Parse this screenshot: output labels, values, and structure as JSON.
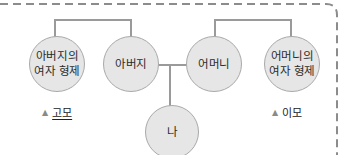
{
  "diagram": {
    "type": "family-tree",
    "colors": {
      "node_fill": "#e6e6e6",
      "node_border": "#a9a9a9",
      "connector": "#9a9a9a",
      "dashed_border": "#8c8c8c",
      "text": "#2b2b2b"
    },
    "nodes": [
      {
        "id": "father-sister",
        "lines": [
          "아버지의",
          "여자 형제"
        ]
      },
      {
        "id": "father",
        "lines": [
          "아버지"
        ]
      },
      {
        "id": "mother",
        "lines": [
          "어머니"
        ]
      },
      {
        "id": "mother-sister",
        "lines": [
          "어머니의",
          "여자 형제"
        ]
      },
      {
        "id": "me",
        "lines": [
          "나"
        ]
      }
    ],
    "edges": [
      {
        "from": "father-sister",
        "to": "father",
        "kind": "sibling"
      },
      {
        "from": "mother",
        "to": "mother-sister",
        "kind": "sibling"
      },
      {
        "from": "father",
        "to": "mother",
        "kind": "marriage"
      },
      {
        "from": "father+mother",
        "to": "me",
        "kind": "child"
      }
    ],
    "labels": [
      {
        "marker": "▲",
        "text": "고모",
        "target": "father-sister",
        "underlined": true
      },
      {
        "marker": "▲",
        "text": "이모",
        "target": "mother-sister",
        "underlined": false
      }
    ]
  }
}
